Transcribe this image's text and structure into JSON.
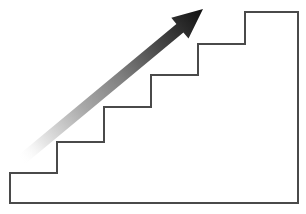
{
  "figure": {
    "background_color": "#ffffff",
    "width": 306,
    "height": 214
  },
  "staircase": {
    "name": "staircase-outline",
    "stroke_color": "#4a4a4a",
    "stroke_width": 2,
    "fill_color": "#ffffff",
    "step_count": 6,
    "outline_points": "10,203 10,173 57,173 57,142 104,142 104,107 151,107 151,75 198,75 198,44 245,44 245,12 298,12 298,203",
    "steps": [
      {
        "label": "step-1",
        "riser_x": 10,
        "tread_y": 173
      },
      {
        "label": "step-2",
        "riser_x": 57,
        "tread_y": 142
      },
      {
        "label": "step-3",
        "riser_x": 104,
        "tread_y": 107
      },
      {
        "label": "step-4",
        "riser_x": 151,
        "tread_y": 75
      },
      {
        "label": "step-5",
        "riser_x": 198,
        "tread_y": 44
      },
      {
        "label": "step-6",
        "riser_x": 245,
        "tread_y": 12
      }
    ],
    "baseline_y": 203,
    "right_edge_x": 298
  },
  "arrow": {
    "name": "growth-arrow",
    "direction": "up-right",
    "tail": {
      "x": 20,
      "y": 161
    },
    "tip": {
      "x": 203,
      "y": 9
    },
    "shaft_width": 11,
    "head_length": 30,
    "head_width": 27,
    "gradient": {
      "type": "linear",
      "from_color": "#ffffff",
      "mid_color": "#808080",
      "to_color": "#111111",
      "stops": [
        {
          "offset": "0%",
          "color": "#ffffff",
          "opacity": 0.0
        },
        {
          "offset": "12%",
          "color": "#e8e8e8",
          "opacity": 1.0
        },
        {
          "offset": "35%",
          "color": "#a8a8a8",
          "opacity": 1.0
        },
        {
          "offset": "55%",
          "color": "#808080",
          "opacity": 1.0
        },
        {
          "offset": "75%",
          "color": "#4a4a4a",
          "opacity": 1.0
        },
        {
          "offset": "100%",
          "color": "#111111",
          "opacity": 1.0
        }
      ]
    }
  }
}
